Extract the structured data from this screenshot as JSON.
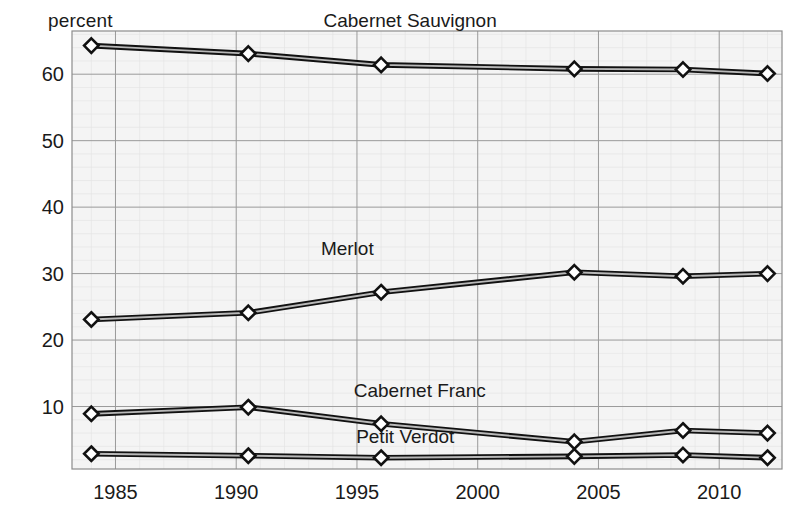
{
  "chart_data": {
    "type": "line",
    "title": "",
    "subtitle": "",
    "ylabel": "percent",
    "xlabel": "",
    "xlim": [
      1983.2,
      2012.6
    ],
    "ylim": [
      0.6,
      66.5
    ],
    "yticks": [
      10,
      20,
      30,
      40,
      50,
      60
    ],
    "xticks": [
      1985,
      1990,
      1995,
      2000,
      2005,
      2010
    ],
    "grid": true,
    "legend_position": "inline-labels",
    "x": [
      1984,
      1990.5,
      1996,
      2004,
      2008.5,
      2012
    ],
    "series": [
      {
        "name": "Cabernet Sauvignon",
        "color": "#3b3b3b",
        "values": [
          64.3,
          63.1,
          61.4,
          60.8,
          60.7,
          60.1
        ],
        "label_x": 1997.2,
        "label_y": 67.8
      },
      {
        "name": "Merlot",
        "color": "#5a5a5a",
        "values": [
          23.1,
          24.1,
          27.2,
          30.2,
          29.6,
          30.0
        ],
        "label_x": 1994.6,
        "label_y": 33.6
      },
      {
        "name": "Cabernet Franc",
        "color": "#2e2e2e",
        "values": [
          8.9,
          9.9,
          7.4,
          4.7,
          6.4,
          6.0
        ],
        "label_x": 1997.6,
        "label_y": 12.2
      },
      {
        "name": "Petit Verdot",
        "color": "#4a4a4a",
        "values": [
          2.9,
          2.6,
          2.3,
          2.5,
          2.7,
          2.3
        ],
        "label_x": 1997.0,
        "label_y": 5.2
      }
    ]
  },
  "axes": {
    "ylabel_text": "percent"
  },
  "colors": {
    "plot_background": "#f4f4f4",
    "grid_major": "#9a9a9a",
    "grid_minor": "#e2e2e2",
    "frame": "#8c8c8c",
    "text": "#1a1a1a",
    "marker_fill": "#ffffff",
    "marker_stroke": "#111111"
  }
}
